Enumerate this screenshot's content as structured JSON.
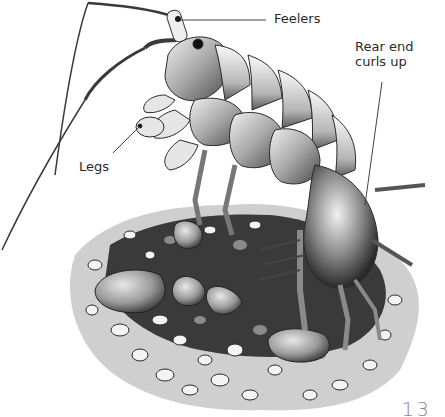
{
  "illustration": {
    "subject": "amphipod (sand hopper) on gravel",
    "colors": {
      "ink": "#1a1a1a",
      "mid": "#7a7a7a",
      "light": "#d8d8d8",
      "paper": "#ffffff"
    }
  },
  "labels": {
    "feelers": "Feelers",
    "rear_end": "Rear end curls up",
    "legs": "Legs"
  },
  "page": {
    "number": "13"
  }
}
